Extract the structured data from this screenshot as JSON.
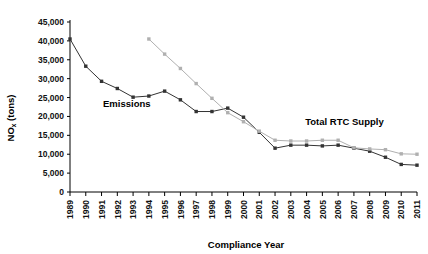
{
  "chart_data": {
    "type": "line",
    "title": "",
    "xlabel": "Compliance Year",
    "ylabel": "NOx (tons)",
    "ylabel_main": "NO",
    "ylabel_sub": "x",
    "ylabel_unit": " (tons)",
    "xlim": [
      1989,
      2011
    ],
    "ylim": [
      0,
      45000
    ],
    "ytick_step": 5000,
    "grid": false,
    "legend": "inline-annotations",
    "categories": [
      1989,
      1990,
      1991,
      1992,
      1993,
      1994,
      1995,
      1996,
      1997,
      1998,
      1999,
      2000,
      2001,
      2002,
      2003,
      2004,
      2005,
      2006,
      2007,
      2008,
      2009,
      2010,
      2011
    ],
    "ytick_labels": [
      "0",
      "5,000",
      "10,000",
      "15,000",
      "20,000",
      "25,000",
      "30,000",
      "35,000",
      "40,000",
      "45,000"
    ],
    "ytick_values": [
      0,
      5000,
      10000,
      15000,
      20000,
      25000,
      30000,
      35000,
      40000,
      45000
    ],
    "xtick_labels": [
      "1989",
      "1990",
      "1991",
      "1992",
      "1993",
      "1994",
      "1995",
      "1996",
      "1997",
      "1998",
      "1999",
      "2000",
      "2001",
      "2002",
      "2003",
      "2004",
      "2005",
      "2006",
      "2007",
      "2008",
      "2009",
      "2010",
      "2011"
    ],
    "series": [
      {
        "name": "Emissions",
        "color": "#333333",
        "marker": "square",
        "x": [
          1989,
          1990,
          1991,
          1992,
          1993,
          1994,
          1995,
          1996,
          1997,
          1998,
          1999,
          2000,
          2001,
          2002,
          2003,
          2004,
          2005,
          2006,
          2007,
          2008,
          2009,
          2010,
          2011
        ],
        "values": [
          40500,
          33300,
          29300,
          27400,
          25100,
          25400,
          26700,
          24400,
          21300,
          21300,
          22200,
          19800,
          15800,
          11600,
          12400,
          12400,
          12200,
          12400,
          11600,
          10800,
          9200,
          7300,
          7100
        ]
      },
      {
        "name": "Total RTC Supply",
        "color": "#b0b0b0",
        "marker": "square",
        "x": [
          1994,
          1995,
          1996,
          1997,
          1998,
          1999,
          2000,
          2001,
          2002,
          2003,
          2004,
          2005,
          2006,
          2007,
          2008,
          2009,
          2010,
          2011
        ],
        "values": [
          40500,
          36500,
          32700,
          28700,
          24800,
          21000,
          18600,
          16100,
          13700,
          13500,
          13500,
          13700,
          13700,
          11700,
          11400,
          11200,
          10100,
          10000
        ]
      }
    ],
    "annotations": [
      {
        "text": "Emissions",
        "x": 1992.6,
        "y": 22600
      },
      {
        "text": "Total RTC Supply",
        "x": 2006.4,
        "y": 17800
      }
    ]
  }
}
